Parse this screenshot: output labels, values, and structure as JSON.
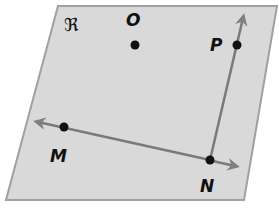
{
  "diagram": {
    "plane": {
      "label": "ℜ",
      "fill": "#d9d9d9",
      "stroke": "#9a9a9a"
    },
    "points": [
      {
        "name": "O",
        "x": 135,
        "y": 45
      },
      {
        "name": "P",
        "x": 237,
        "y": 45
      },
      {
        "name": "M",
        "x": 64,
        "y": 127
      },
      {
        "name": "N",
        "x": 210,
        "y": 160
      }
    ],
    "figures": [
      {
        "type": "ray",
        "from": "N",
        "through": "P"
      },
      {
        "type": "line",
        "through": [
          "M",
          "N"
        ]
      }
    ],
    "colors": {
      "line": "#7a7a7a",
      "point": "#111111"
    }
  }
}
